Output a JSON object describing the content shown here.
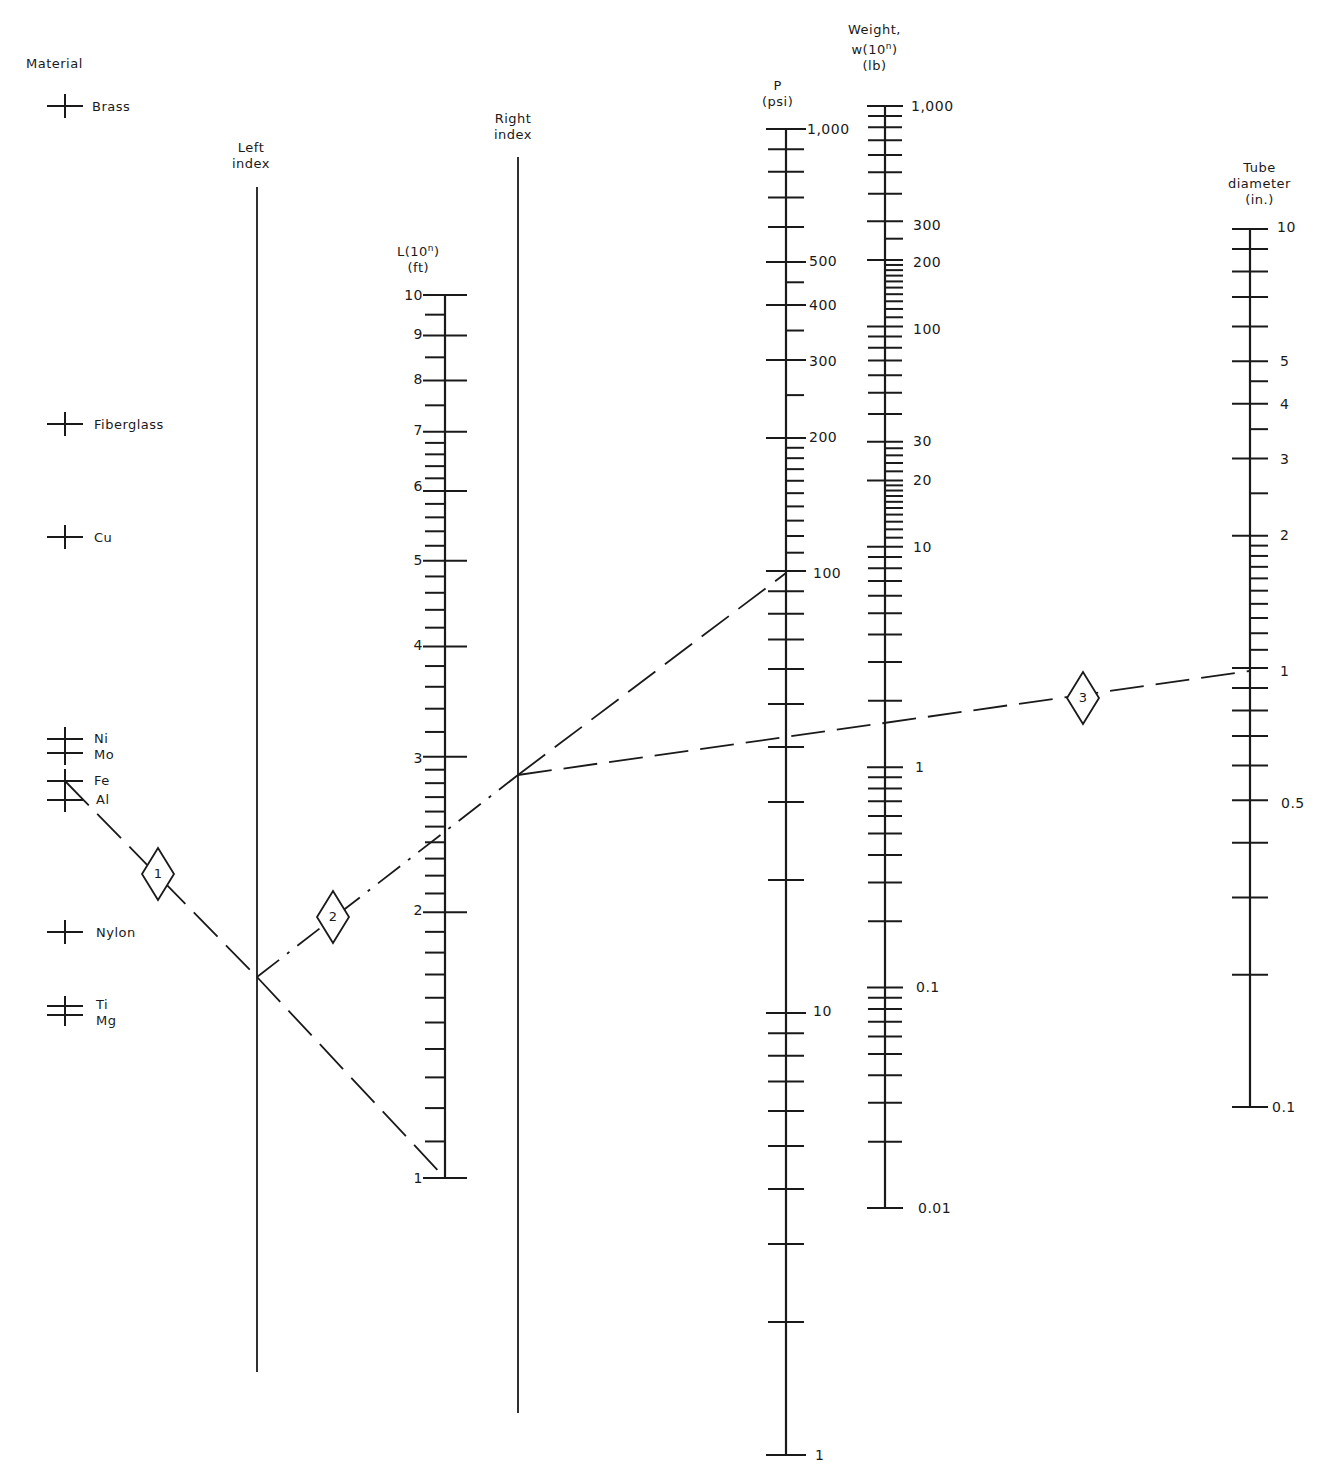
{
  "chart_data": {
    "type": "nomograph",
    "title": "",
    "scales": {
      "material": {
        "header": "Material",
        "x": 65,
        "items": [
          {
            "label": "Brass",
            "y": 106
          },
          {
            "label": "Fiberglass",
            "y": 424
          },
          {
            "label": "Cu",
            "y": 537
          },
          {
            "label": "Ni",
            "y": 739
          },
          {
            "label": "Mo",
            "y": 753
          },
          {
            "label": "Fe",
            "y": 781
          },
          {
            "label": "Al",
            "y": 800
          },
          {
            "label": "Nylon",
            "y": 932
          },
          {
            "label": "Ti",
            "y": 1006
          },
          {
            "label": "Mg",
            "y": 1015
          }
        ]
      },
      "left_index": {
        "header_line1": "Left",
        "header_line2": "index",
        "x": 257,
        "y_top": 187,
        "y_bottom": 1372
      },
      "right_index": {
        "header_line1": "Right",
        "header_line2": "index",
        "x": 518,
        "y_top": 157,
        "y_bottom": 1413
      },
      "length": {
        "header_line1": "L(10",
        "header_sup": "n",
        "header_line1_end": ")",
        "header_line2": "(ft)",
        "x": 445,
        "y_top": 295,
        "y_bottom": 1178,
        "log_min": 1,
        "log_max": 10,
        "labels": [
          "1",
          "2",
          "3",
          "4",
          "5",
          "6",
          "7",
          "8",
          "9",
          "10"
        ],
        "label_values": [
          1,
          2,
          3,
          4,
          5,
          6,
          7,
          8,
          9,
          10
        ]
      },
      "pressure": {
        "header_line1": "P",
        "header_line2": "(psi)",
        "x": 786,
        "y_top": 129,
        "y_bottom": 1455,
        "log_min": 1,
        "log_max": 1000,
        "labels": [
          "1",
          "10",
          "100",
          "200",
          "300",
          "400",
          "500",
          "1,000"
        ],
        "label_values": [
          1,
          10,
          100,
          200,
          300,
          400,
          500,
          1000
        ]
      },
      "weight": {
        "header_line1": "Weight,",
        "header_line2a": "w(10",
        "header_sup": "n",
        "header_line2b": ")",
        "header_line3": "(lb)",
        "x": 885,
        "y_top": 106,
        "y_bottom": 1208,
        "log_min": 0.01,
        "log_max": 1000,
        "labels": [
          "0.01",
          "0.1",
          "1",
          "10",
          "20",
          "30",
          "100",
          "200",
          "300",
          "1,000"
        ],
        "label_values": [
          0.01,
          0.1,
          1,
          10,
          20,
          30,
          100,
          200,
          300,
          1000
        ]
      },
      "tube_diameter": {
        "header_line1": "Tube",
        "header_line2": "diameter",
        "header_line3": "(in.)",
        "x": 1250,
        "y_top": 229,
        "y_bottom": 1107,
        "log_min": 0.1,
        "log_max": 10,
        "labels": [
          "0.1",
          "0.5",
          "1",
          "2",
          "3",
          "4",
          "5",
          "10"
        ],
        "label_values": [
          0.1,
          0.5,
          1,
          2,
          3,
          4,
          5,
          10
        ]
      }
    },
    "solution_lines": [
      {
        "step": "1",
        "from": "Fe (material)",
        "through": "Left index",
        "to": "L = 1",
        "points": [
          [
            65,
            781
          ],
          [
            257,
            977
          ],
          [
            445,
            1178
          ]
        ],
        "badge": [
          158,
          874
        ]
      },
      {
        "step": "2",
        "from": "Left index",
        "through": "L ≈ 2.5",
        "to": "Right index",
        "points": [
          [
            257,
            977
          ],
          [
            518,
            775
          ]
        ],
        "badge": [
          333,
          917
        ]
      },
      {
        "step": "2b",
        "from": "Right index",
        "to": "P = 100 psi",
        "points": [
          [
            518,
            775
          ],
          [
            786,
            573
          ]
        ]
      },
      {
        "step": "3",
        "from": "Right index",
        "through": "w ≈ 1.5",
        "to": "Tube diameter = 1 in.",
        "points": [
          [
            518,
            775
          ],
          [
            1250,
            671
          ]
        ],
        "badge": [
          1083,
          698
        ]
      }
    ]
  }
}
